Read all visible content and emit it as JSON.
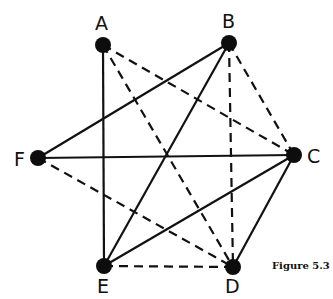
{
  "figure": {
    "caption": "Figure 5.3"
  },
  "graph": {
    "nodes": [
      {
        "id": "A",
        "label": "A",
        "x": 103,
        "y": 45,
        "label_x": 95,
        "label_y": 30
      },
      {
        "id": "B",
        "label": "B",
        "x": 229,
        "y": 43,
        "label_x": 222,
        "label_y": 28
      },
      {
        "id": "C",
        "label": "C",
        "x": 294,
        "y": 155,
        "label_x": 307,
        "label_y": 163
      },
      {
        "id": "D",
        "label": "D",
        "x": 233,
        "y": 267,
        "label_x": 225,
        "label_y": 293
      },
      {
        "id": "E",
        "label": "E",
        "x": 104,
        "y": 266,
        "label_x": 97,
        "label_y": 293
      },
      {
        "id": "F",
        "label": "F",
        "x": 38,
        "y": 158,
        "label_x": 14,
        "label_y": 166
      }
    ],
    "edges": [
      {
        "from": "A",
        "to": "E",
        "style": "solid"
      },
      {
        "from": "F",
        "to": "B",
        "style": "solid"
      },
      {
        "from": "F",
        "to": "C",
        "style": "solid"
      },
      {
        "from": "B",
        "to": "E",
        "style": "solid"
      },
      {
        "from": "C",
        "to": "E",
        "style": "solid"
      },
      {
        "from": "C",
        "to": "D",
        "style": "solid"
      },
      {
        "from": "A",
        "to": "C",
        "style": "dashed"
      },
      {
        "from": "A",
        "to": "D",
        "style": "dashed"
      },
      {
        "from": "B",
        "to": "C",
        "style": "dashed"
      },
      {
        "from": "B",
        "to": "D",
        "style": "dashed"
      },
      {
        "from": "F",
        "to": "D",
        "style": "dashed"
      },
      {
        "from": "E",
        "to": "D",
        "style": "dashed"
      }
    ],
    "node_color": "#0d0d0d",
    "edge_color": "#111111",
    "background": "#ffffff"
  }
}
